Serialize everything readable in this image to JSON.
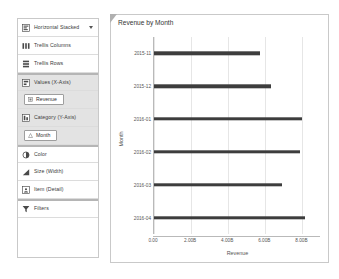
{
  "shelf": {
    "mark_type": {
      "label": "Horizontal Stacked",
      "icon": "horizontal-stacked-icon",
      "caret": "chevron-down-icon"
    },
    "rows": [
      {
        "label": "Trellis Columns",
        "icon": "trellis-columns-icon",
        "shaded": false,
        "divider_above": false
      },
      {
        "label": "Trellis Rows",
        "icon": "trellis-rows-icon",
        "shaded": false,
        "divider_above": false
      },
      {
        "label": "Values (X-Axis)",
        "icon": "values-x-axis-icon",
        "shaded": true,
        "divider_above": true
      },
      {
        "label": "Category (Y-Axis)",
        "icon": "category-y-axis-icon",
        "shaded": true,
        "divider_above": false
      },
      {
        "label": "Color",
        "icon": "color-icon",
        "shaded": false,
        "divider_above": true
      },
      {
        "label": "Size (Width)",
        "icon": "size-width-icon",
        "shaded": false,
        "divider_above": false
      },
      {
        "label": "Item (Detail)",
        "icon": "item-detail-icon",
        "shaded": false,
        "divider_above": false
      },
      {
        "label": "Filters",
        "icon": "filter-icon",
        "shaded": false,
        "divider_above": true
      }
    ],
    "pills": {
      "values": {
        "label": "Revenue",
        "icon": "measure-icon"
      },
      "category": {
        "label": "Month",
        "icon": "attribute-icon"
      }
    }
  },
  "chart_data": {
    "type": "bar",
    "orientation": "horizontal",
    "title": "Revenue by Month",
    "xlabel": "Revenue",
    "ylabel": "Month",
    "categories": [
      "2015-11",
      "2015-12",
      "2016-01",
      "2016-02",
      "2016-03",
      "2016-04"
    ],
    "values": [
      5750000000,
      6350000000,
      8000000000,
      7900000000,
      6950000000,
      8200000000
    ],
    "xticks": [
      0,
      2000000000,
      4000000000,
      6000000000,
      8000000000
    ],
    "xtick_labels": [
      "0.00",
      "2.00B",
      "4.00B",
      "6.00B",
      "8.00B"
    ],
    "xlim": [
      0,
      9000000000
    ],
    "grid": true,
    "legend": false,
    "bar_color": "#3d3d3d"
  },
  "colors": {
    "bar": "#3d3d3d",
    "panel_border": "#c9c9c9",
    "shaded_row": "#e3e3e3",
    "gridline": "#e6e6e6",
    "text": "#3a3a3a"
  }
}
